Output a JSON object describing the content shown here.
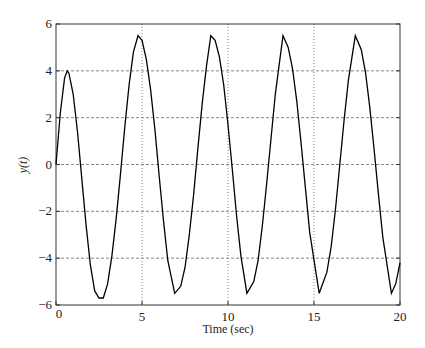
{
  "chart_data": {
    "type": "line",
    "title": "",
    "xlabel": "Time (sec)",
    "ylabel": "y(t)",
    "xlim": [
      0,
      20
    ],
    "ylim": [
      -6,
      6
    ],
    "xticks": [
      0,
      5,
      10,
      15,
      20
    ],
    "yticks": [
      -6,
      -4,
      -2,
      0,
      2,
      4,
      6
    ],
    "xtick_labels": [
      "0",
      "5",
      "10",
      "15",
      "20"
    ],
    "ytick_labels": [
      "−6",
      "−4",
      "−2",
      "0",
      "2",
      "4",
      "6"
    ],
    "grid": true,
    "legend": null,
    "series": [
      {
        "name": "y(t)",
        "color": "#000000",
        "x": [
          0,
          0.25,
          0.5,
          0.65,
          0.75,
          1,
          1.25,
          1.5,
          1.75,
          2,
          2.25,
          2.5,
          2.75,
          3,
          3.25,
          3.5,
          3.75,
          4,
          4.25,
          4.5,
          4.77,
          5,
          5.25,
          5.5,
          5.75,
          6,
          6.25,
          6.5,
          6.9,
          7.25,
          7.5,
          7.75,
          8,
          8.25,
          8.5,
          8.75,
          9.0,
          9.25,
          9.5,
          9.75,
          10,
          10.25,
          10.5,
          10.75,
          11.1,
          11.5,
          11.75,
          12,
          12.25,
          12.5,
          12.75,
          13.2,
          13.5,
          13.75,
          14,
          14.25,
          14.5,
          14.75,
          15.3,
          15.75,
          16,
          16.25,
          16.5,
          16.75,
          17,
          17.4,
          17.75,
          18,
          18.25,
          18.5,
          18.75,
          19,
          19.5,
          19.75,
          20
        ],
        "y": [
          0,
          2.2,
          3.7,
          4.0,
          3.9,
          3.0,
          1.4,
          -0.6,
          -2.6,
          -4.3,
          -5.4,
          -5.7,
          -5.7,
          -5.1,
          -3.9,
          -2.3,
          -0.4,
          1.6,
          3.4,
          4.8,
          5.5,
          5.3,
          4.5,
          3.2,
          1.5,
          -0.5,
          -2.4,
          -4.1,
          -5.5,
          -5.2,
          -4.4,
          -3.0,
          -1.3,
          0.7,
          2.6,
          4.2,
          5.5,
          5.3,
          4.6,
          3.4,
          1.7,
          -0.2,
          -2.2,
          -3.9,
          -5.5,
          -5.0,
          -4.1,
          -2.6,
          -0.8,
          1.1,
          3.0,
          5.5,
          5.0,
          4.1,
          2.7,
          0.9,
          -1.0,
          -2.9,
          -5.5,
          -4.6,
          -3.5,
          -1.9,
          0.0,
          1.9,
          3.6,
          5.5,
          4.9,
          3.9,
          2.4,
          0.6,
          -1.3,
          -3.1,
          -5.5,
          -5.1,
          -4.2
        ]
      }
    ]
  }
}
